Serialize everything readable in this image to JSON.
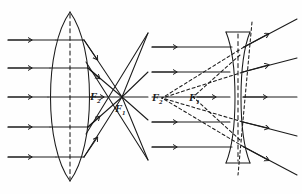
{
  "figure": {
    "background_color": "#fefefe",
    "ink_color": "#1a1a1a",
    "width": 302,
    "height": 194,
    "panels": [
      {
        "id": "converging",
        "name": "converging-lens-panel",
        "lens_type": "biconvex",
        "description": "Parallel rays converge to a real focal point",
        "ray_count": 5,
        "ray_y": [
          40,
          68,
          97,
          127,
          157
        ],
        "ray_start_x": 8,
        "lens_center_x": 70,
        "lens_top_y": 12,
        "lens_bottom_y": 181,
        "focus_x": 122,
        "axis_y": 97,
        "labels": [
          {
            "id": "f2",
            "text": "F",
            "sub": "2",
            "x": 92,
            "y": 99
          },
          {
            "id": "f1",
            "text": "F",
            "sub": "1",
            "x": 116,
            "y": 110
          }
        ]
      },
      {
        "id": "diverging",
        "name": "diverging-lens-panel",
        "lens_type": "biconcave",
        "description": "Parallel rays diverge; dashed back-extensions meet at a virtual focus",
        "ray_count": 5,
        "ray_y": [
          47,
          72,
          97,
          122,
          147
        ],
        "ray_start_x": 152,
        "lens_center_x": 238,
        "lens_top_y": 32,
        "lens_bottom_y": 163,
        "virtual_focus_x": 193,
        "outer_focus_x": 160,
        "axis_y": 97,
        "labels": [
          {
            "id": "f2",
            "text": "F",
            "sub": "2",
            "x": 154,
            "y": 100
          },
          {
            "id": "f1",
            "text": "F",
            "sub": "1",
            "x": 191,
            "y": 100
          }
        ]
      }
    ]
  }
}
